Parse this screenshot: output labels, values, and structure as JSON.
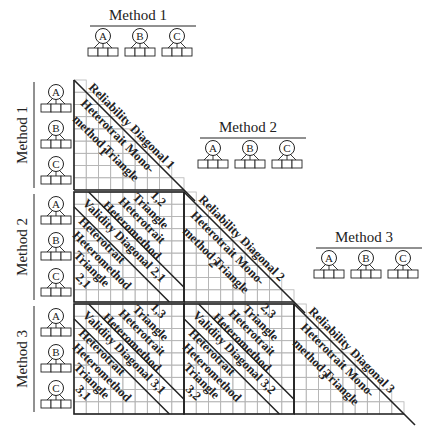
{
  "diagram": {
    "methods": [
      "Method 1",
      "Method 2",
      "Method 3"
    ],
    "traits": [
      "A",
      "B",
      "C"
    ],
    "blocks": {
      "reliability": [
        {
          "label": "Reliability Diagonal 1"
        },
        {
          "label": "Reliability Diagonal 2"
        },
        {
          "label": "Reliability Diagonal 3"
        }
      ],
      "monomethod": [
        {
          "line1": "Heterotrait Mono-",
          "line2": "method Triangle",
          "line3": "1"
        },
        {
          "line1": "Heterotrait Mono-",
          "line2": "method Triangle",
          "line3": "2"
        },
        {
          "line1": "Heterotrait Mono-",
          "line2": "method Triangle",
          "line3": "3"
        }
      ],
      "heteromethod": [
        {
          "id": "2,1",
          "validity": "Validity Diagonal 2,1",
          "upper": [
            "1,2",
            "Triangle",
            "Heterotrait",
            "Heteromethod"
          ],
          "lower": [
            "Heterotrait",
            "Heteromethod",
            "Triangle",
            "2,1"
          ]
        },
        {
          "id": "3,1",
          "validity": "Validity Diagonal 3,1",
          "upper": [
            "1,3",
            "Triangle",
            "Heterotrait",
            "Heteromethod"
          ],
          "lower": [
            "Heterotrait",
            "Heteromethod",
            "Triangle",
            "3,1"
          ]
        },
        {
          "id": "3,2",
          "validity": "Validity Diagonal 3,2",
          "upper": [
            "2,3",
            "Triangle",
            "Heterotrait",
            "Heteromethod"
          ],
          "lower": [
            "Heterotrait",
            "Heteromethod",
            "Triangle",
            "3,2"
          ]
        }
      ]
    },
    "colors": {
      "line": "#222222",
      "grid": "#b5b5b5",
      "text": "#222222"
    }
  }
}
